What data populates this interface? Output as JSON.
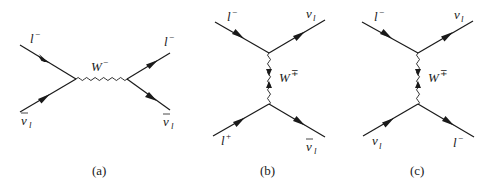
{
  "figure": {
    "panels": [
      {
        "caption": "(a)",
        "type": "s-channel",
        "boson": {
          "symbol": "W",
          "charge": "−"
        },
        "particles": {
          "in_top": {
            "symbol": "l",
            "sup": "−",
            "sub": ""
          },
          "in_bottom": {
            "symbol": "ν",
            "bar": true,
            "sub": "l"
          },
          "out_top": {
            "symbol": "l",
            "sup": "−",
            "sub": ""
          },
          "out_bottom": {
            "symbol": "ν",
            "bar": true,
            "sub": "l"
          }
        }
      },
      {
        "caption": "(b)",
        "type": "t-channel",
        "boson": {
          "symbol": "W",
          "charge": "∓"
        },
        "particles": {
          "in_top": {
            "symbol": "l",
            "sup": "−",
            "sub": ""
          },
          "out_top": {
            "symbol": "ν",
            "bar": false,
            "sub": "l"
          },
          "in_bottom": {
            "symbol": "l",
            "sup": "+",
            "sub": ""
          },
          "out_bottom": {
            "symbol": "ν",
            "bar": true,
            "sub": "l"
          }
        }
      },
      {
        "caption": "(c)",
        "type": "t-channel",
        "boson": {
          "symbol": "W",
          "charge": "∓"
        },
        "particles": {
          "in_top": {
            "symbol": "l",
            "sup": "−",
            "sub": ""
          },
          "out_top": {
            "symbol": "ν",
            "bar": false,
            "sub": "l"
          },
          "in_bottom": {
            "symbol": "ν",
            "bar": false,
            "sub": "l"
          },
          "out_bottom": {
            "symbol": "l",
            "sup": "−",
            "sub": ""
          }
        }
      }
    ]
  }
}
